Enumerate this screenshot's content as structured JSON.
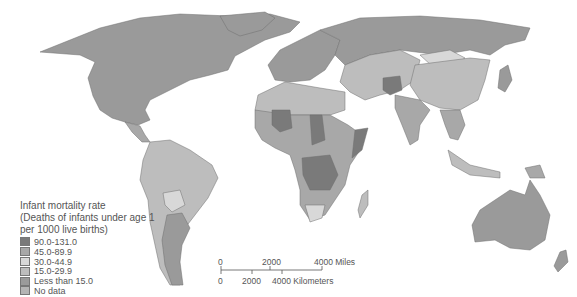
{
  "colors": {
    "c90_131": "#7a7a7a",
    "c45_89": "#a8a8a8",
    "c30_44": "#d8d8d8",
    "c15_29": "#bdbdbd",
    "lt15": "#9a9a9a",
    "nodata": "#b4b4b4",
    "ocean": "#ffffff"
  },
  "legend": {
    "title_line1": "Infant mortality rate",
    "title_line2": "(Deaths of infants under age 1",
    "title_line3": "per 1000 live births)",
    "items": [
      {
        "label": "90.0-131.0",
        "color": "#7a7a7a"
      },
      {
        "label": "45.0-89.9",
        "color": "#a8a8a8"
      },
      {
        "label": "30.0-44.9",
        "color": "#d8d8d8"
      },
      {
        "label": "15.0-29.9",
        "color": "#bdbdbd"
      },
      {
        "label": "Less than 15.0",
        "color": "#9a9a9a"
      },
      {
        "label": "No data",
        "color": "#b4b4b4"
      }
    ]
  },
  "scale_bar": {
    "miles_0": "0",
    "miles_2000": "2000",
    "miles_4000": "4000 Miles",
    "km_0": "0",
    "km_2000": "2000",
    "km_4000": "4000 Kilometers"
  }
}
